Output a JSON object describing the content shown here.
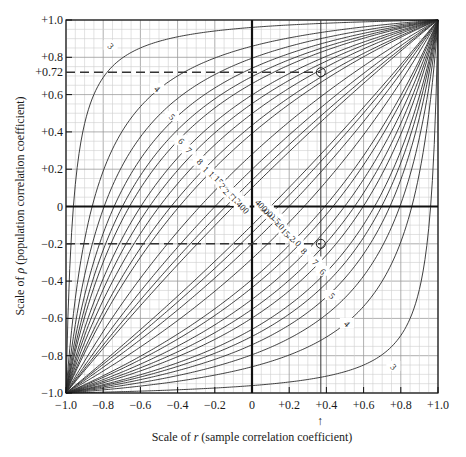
{
  "chart_data": {
    "type": "line",
    "title": "",
    "xlabel": "Scale of r (sample correlation coefficient)",
    "ylabel": "Scale of ρ (population correlation coefficient)",
    "xlim": [
      -1.0,
      1.0
    ],
    "ylim": [
      -1.0,
      1.0
    ],
    "grid": true,
    "grid_minor_step": 0.05,
    "x_ticks": [
      "−1.0",
      "−0.8",
      "−0.6",
      "−0.4",
      "−0.2",
      "0",
      "+0.2",
      "+0.4",
      "+0.6",
      "+0.8",
      "+1.0"
    ],
    "x_tick_values": [
      -1.0,
      -0.8,
      -0.6,
      -0.4,
      -0.2,
      0,
      0.2,
      0.4,
      0.6,
      0.8,
      1.0
    ],
    "y_ticks": [
      "+1.0",
      "+0.8",
      "+0.6",
      "+0.4",
      "+0.2",
      "0",
      "−0.2",
      "−0.4",
      "−0.6",
      "−0.8",
      "−1.0"
    ],
    "y_tick_values": [
      1.0,
      0.8,
      0.6,
      0.4,
      0.2,
      0,
      -0.2,
      -0.4,
      -0.6,
      -0.8,
      -1.0
    ],
    "extra_y_tick": {
      "label": "+0.72",
      "value": 0.72
    },
    "curve_family": "confidence belts for ρ by sample size n (upper and lower bound pairs)",
    "sample_sizes": [
      3,
      4,
      5,
      6,
      7,
      8,
      10,
      12,
      15,
      20,
      25,
      50,
      100,
      200,
      400
    ],
    "upper_label_order": [
      "3",
      "4",
      "5",
      "6",
      "7",
      "8",
      "10",
      "12",
      "15",
      "20",
      "25",
      "50",
      "100",
      "200",
      "400"
    ],
    "lower_label_order": [
      "400",
      "200",
      "100",
      "50",
      "25",
      "20",
      "15",
      "12",
      "10",
      "8",
      "7",
      "6",
      "5",
      "4",
      "3"
    ],
    "bound_at_r0": {
      "3": 0.96,
      "4": 0.86,
      "5": 0.78,
      "6": 0.74,
      "7": 0.7,
      "8": 0.66
    },
    "example_reading": {
      "r": 0.37,
      "rho_upper": 0.72,
      "rho_lower": -0.2,
      "arrow_marker_x": 0.37
    },
    "annotations": [
      {
        "type": "dashed-hline",
        "y": 0.72,
        "x_from": -1.0,
        "x_to": 0.37
      },
      {
        "type": "dashed-hline",
        "y": -0.2,
        "x_from": -1.0,
        "x_to": 0.37
      },
      {
        "type": "vline",
        "x": 0.37
      },
      {
        "type": "circle",
        "x": 0.37,
        "y": 0.72
      },
      {
        "type": "circle",
        "x": 0.37,
        "y": -0.2
      },
      {
        "type": "arrow-up",
        "x": 0.37,
        "label": "↑"
      }
    ]
  },
  "labels": {
    "x_axis_title": "Scale of r (sample correlation coefficient)",
    "x_axis_title_prefix": "Scale of ",
    "x_axis_title_var": "r",
    "x_axis_title_suffix": " (sample correlation coefficient)",
    "y_axis_title_prefix": "Scale of ",
    "y_axis_title_var": "ρ",
    "y_axis_title_suffix": " (population correlation coefficient)",
    "arrow": "↑"
  }
}
